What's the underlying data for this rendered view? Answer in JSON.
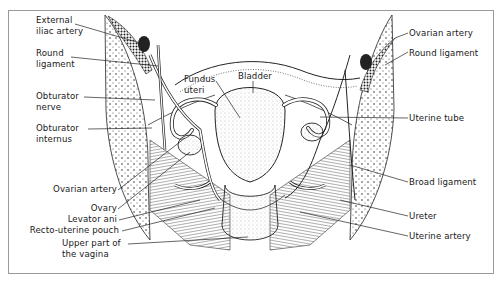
{
  "figure": {
    "type": "anatomical-illustration",
    "labels_left": [
      {
        "id": "external-iliac-artery",
        "line1": "External",
        "line2": "iliac artery"
      },
      {
        "id": "round-ligament-left",
        "line1": "Round",
        "line2": "ligament"
      },
      {
        "id": "obturator-nerve",
        "line1": "Obturator",
        "line2": "nerve"
      },
      {
        "id": "obturator-internus",
        "line1": "Obturator",
        "line2": "internus"
      },
      {
        "id": "ovarian-artery-left",
        "line1": "Ovarian artery"
      },
      {
        "id": "ovary",
        "line1": "Ovary"
      },
      {
        "id": "levator-ani",
        "line1": "Levator ani"
      },
      {
        "id": "recto-uterine-pouch",
        "line1": "Recto-uterine pouch"
      },
      {
        "id": "upper-part-vagina",
        "line1": "Upper part of",
        "line2": "the vagina"
      }
    ],
    "labels_center": [
      {
        "id": "fundus-uteri",
        "line1": "Fundus",
        "line2": "uteri"
      },
      {
        "id": "bladder",
        "line1": "Bladder"
      }
    ],
    "labels_right": [
      {
        "id": "ovarian-artery-right",
        "line1": "Ovarian artery"
      },
      {
        "id": "round-ligament-right",
        "line1": "Round ligament"
      },
      {
        "id": "uterine-tube",
        "line1": "Uterine tube"
      },
      {
        "id": "broad-ligament",
        "line1": "Broad ligament"
      },
      {
        "id": "ureter",
        "line1": "Ureter"
      },
      {
        "id": "uterine-artery",
        "line1": "Uterine artery"
      }
    ],
    "colors": {
      "ink": "#1a1a1a",
      "frame": "#9a9a9a",
      "background": "#ffffff"
    }
  }
}
